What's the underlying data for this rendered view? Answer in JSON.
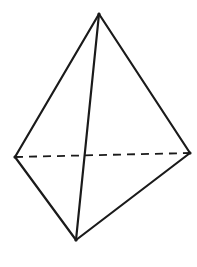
{
  "diagram": {
    "type": "tetrahedron",
    "colors": {
      "stroke": "#1a1a1a",
      "background": "#ffffff"
    },
    "vertices": {
      "top": {
        "x": 99,
        "y": 14
      },
      "left": {
        "x": 15,
        "y": 157
      },
      "right": {
        "x": 190,
        "y": 153
      },
      "bottom": {
        "x": 76,
        "y": 240
      }
    },
    "edges": [
      {
        "from": "top",
        "to": "left",
        "style": "solid"
      },
      {
        "from": "top",
        "to": "right",
        "style": "solid"
      },
      {
        "from": "top",
        "to": "bottom",
        "style": "solid"
      },
      {
        "from": "left",
        "to": "bottom",
        "style": "solid"
      },
      {
        "from": "right",
        "to": "bottom",
        "style": "solid"
      },
      {
        "from": "left",
        "to": "right",
        "style": "dashed"
      }
    ]
  }
}
